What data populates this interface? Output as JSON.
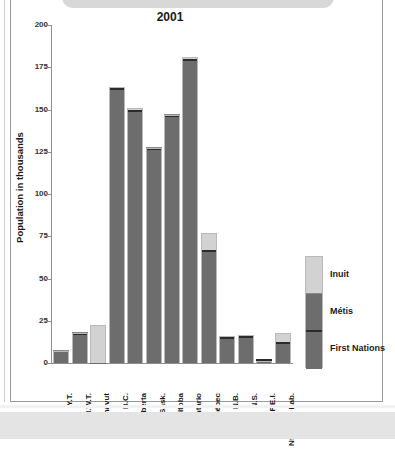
{
  "banner": {
    "text": "PROVINCES AND TERRITORIES"
  },
  "chart_data": {
    "type": "bar",
    "subtype": "stacked",
    "title": "2001",
    "xlabel": "",
    "ylabel": "Population in thousands",
    "ylim": [
      0,
      200
    ],
    "yticks": [
      0,
      25,
      50,
      75,
      100,
      125,
      150,
      175,
      200
    ],
    "ytick_labels": [
      "0",
      "25",
      "50",
      "75",
      "100",
      "125",
      "150",
      "175",
      "200"
    ],
    "grid": false,
    "legend_position": "right",
    "categories": [
      "Y.T.",
      "N.W.T.",
      "Nunavut",
      "B.C.",
      "Alberta",
      "Sask.",
      "Manitoba",
      "Ontario",
      "Québec",
      "N.B.",
      "N.S.",
      "P.E.I.",
      "Nfld. and Lab."
    ],
    "series": [
      {
        "name": "First Nations",
        "color": "#6d6d6d",
        "values": [
          6.5,
          14.0,
          0.1,
          118.0,
          84.0,
          83.5,
          90.0,
          131.5,
          51.0,
          11.5,
          12.5,
          1.0,
          7.0
        ]
      },
      {
        "name": "Métis",
        "color": "#6d6d6d",
        "values": [
          0.4,
          3.5,
          0.1,
          44.5,
          66.0,
          43.5,
          56.5,
          48.5,
          16.0,
          4.0,
          3.5,
          0.3,
          5.5
        ]
      },
      {
        "name": "Inuit",
        "color": "#d2d2d2",
        "values": [
          0.1,
          0.4,
          22.5,
          0.8,
          1.0,
          0.2,
          0.5,
          1.3,
          10.0,
          0.2,
          0.4,
          0.0,
          5.5
        ]
      }
    ],
    "totals": [
      7.0,
      17.9,
      22.7,
      163.3,
      151.0,
      127.2,
      147.0,
      181.3,
      77.0,
      15.7,
      16.4,
      1.3,
      18.0
    ],
    "legend_entries": [
      "Inuit",
      "Métis",
      "First Nations"
    ]
  }
}
